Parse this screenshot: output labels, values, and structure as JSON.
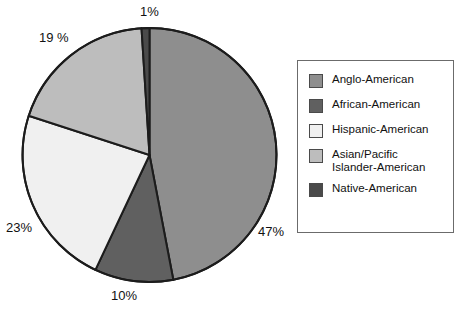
{
  "chart_data": {
    "type": "pie",
    "title": "",
    "categories": [
      "Anglo-American",
      "African-American",
      "Hispanic-American",
      "Asian/Pacific Islander-American",
      "Native-American"
    ],
    "values": [
      47,
      10,
      23,
      19,
      1
    ],
    "unit": "%",
    "legend_position": "right",
    "grid": false,
    "colors": [
      "#8e8e8e",
      "#606060",
      "#f0f0f0",
      "#bdbdbd",
      "#4a4a4a"
    ],
    "slice_labels": [
      "47%",
      "10%",
      "23%",
      "19 %",
      "1%"
    ],
    "start_angle_deg": 0,
    "direction": "clockwise",
    "slices": [
      {
        "label": "Anglo-American",
        "value": 47,
        "display": "47%",
        "color": "#8e8e8e"
      },
      {
        "label": "African-American",
        "value": 10,
        "display": "10%",
        "color": "#606060"
      },
      {
        "label": "Hispanic-American",
        "value": 23,
        "display": "23%",
        "color": "#f0f0f0"
      },
      {
        "label": "Asian/Pacific Islander-American",
        "value": 19,
        "display": "19 %",
        "color": "#bdbdbd"
      },
      {
        "label": "Native-American",
        "value": 1,
        "display": "1%",
        "color": "#4a4a4a"
      }
    ]
  },
  "labels": {
    "anglo": "47%",
    "african": "10%",
    "hispanic": "23%",
    "asian": "19 %",
    "native": "1%"
  },
  "legend": {
    "items": [
      {
        "label": "Anglo-American",
        "line1": "Anglo-American",
        "line2": "",
        "color": "#8e8e8e"
      },
      {
        "label": "African-American",
        "line1": "African-American",
        "line2": "",
        "color": "#606060"
      },
      {
        "label": "Hispanic-American",
        "line1": "Hispanic-American",
        "line2": "",
        "color": "#f0f0f0"
      },
      {
        "label": "Asian/Pacific Islander-American",
        "line1": "Asian/Pacific",
        "line2": "Islander-American",
        "color": "#bdbdbd"
      },
      {
        "label": "Native-American",
        "line1": "Native-American",
        "line2": "",
        "color": "#4a4a4a"
      }
    ],
    "border_color": "#6b6b6b"
  },
  "style": {
    "stroke": "#1c1c1c",
    "background": "#ffffff"
  }
}
